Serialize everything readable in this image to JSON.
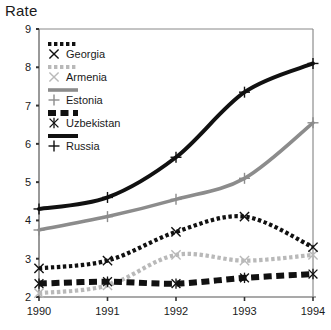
{
  "axis_title": "Rate",
  "legend": {
    "position": "top-left-inside",
    "items": [
      {
        "label": "Georgia",
        "color": "#111111",
        "style": "dotted",
        "marker": "x-marker"
      },
      {
        "label": "Armenia",
        "color": "#b9b9b9",
        "style": "dotted",
        "marker": "x-marker"
      },
      {
        "label": "Estonia",
        "color": "#8c8c8c",
        "style": "solid",
        "marker": "plus-marker"
      },
      {
        "label": "Uzbekistan",
        "color": "#111111",
        "style": "dashed",
        "marker": "asterisk-marker"
      },
      {
        "label": "Russia",
        "color": "#111111",
        "style": "solid-heavy",
        "marker": "plus-marker"
      }
    ]
  },
  "chart_data": {
    "type": "line",
    "title": "",
    "xlabel": "",
    "ylabel": "Rate",
    "x": [
      1990,
      1991,
      1992,
      1993,
      1994
    ],
    "xticklabels": [
      "1990",
      "1991",
      "1992",
      "1993",
      "1994"
    ],
    "yticklabels": [
      "2",
      "3",
      "4",
      "5",
      "6",
      "7",
      "8",
      "9"
    ],
    "xlim": [
      1990,
      1994
    ],
    "ylim": [
      2,
      9
    ],
    "grid": false,
    "series": [
      {
        "name": "Russia",
        "values": [
          4.3,
          4.6,
          5.65,
          7.35,
          8.1
        ],
        "color": "#111111",
        "style": "solid-heavy",
        "marker": "plus-marker"
      },
      {
        "name": "Estonia",
        "values": [
          3.75,
          4.1,
          4.55,
          5.1,
          6.55
        ],
        "color": "#8c8c8c",
        "style": "solid",
        "marker": "plus-marker"
      },
      {
        "name": "Georgia",
        "values": [
          2.75,
          2.95,
          3.7,
          4.1,
          3.3
        ],
        "color": "#111111",
        "style": "dotted",
        "marker": "x-marker"
      },
      {
        "name": "Armenia",
        "values": [
          2.1,
          2.3,
          3.1,
          2.95,
          3.1
        ],
        "color": "#b9b9b9",
        "style": "dotted",
        "marker": "x-marker"
      },
      {
        "name": "Uzbekistan",
        "values": [
          2.35,
          2.4,
          2.35,
          2.5,
          2.6
        ],
        "color": "#111111",
        "style": "dashed",
        "marker": "asterisk-marker"
      }
    ]
  }
}
